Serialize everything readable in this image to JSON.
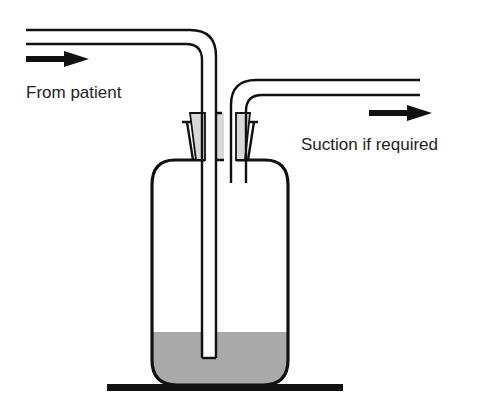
{
  "diagram": {
    "labels": {
      "inlet": "From patient",
      "outlet": "Suction if required"
    },
    "colors": {
      "line": "#111111",
      "liquid": "#a9a9a9",
      "stopper": "#d9d9d9",
      "background": "#ffffff",
      "text": "#222222"
    },
    "components": [
      {
        "id": "inlet-tube",
        "description": "Long tube from patient, submerged below liquid"
      },
      {
        "id": "outlet-tube",
        "description": "Short tube to suction, ending above liquid"
      },
      {
        "id": "bung",
        "description": "Stopper sealing the bottle neck"
      },
      {
        "id": "bottle",
        "description": "Collection bottle"
      },
      {
        "id": "water",
        "description": "Liquid seal in bottom of bottle"
      },
      {
        "id": "base",
        "description": "Floor / resting surface"
      }
    ]
  }
}
